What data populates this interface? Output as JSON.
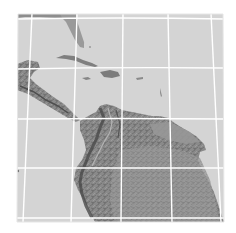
{
  "map": {
    "type": "shaded-relief",
    "region": "Caribbean and northern South America",
    "colors": {
      "background": "#ffffff",
      "ocean": "#d4d4d4",
      "land_light": "#a8a8a8",
      "land_mid": "#8c8c8c",
      "land_dark": "#6e6e6e",
      "ridge": "#4a4a4a",
      "gridline": "#ffffff"
    },
    "frame": {
      "x": 17,
      "y": 13,
      "width": 207,
      "height": 209
    },
    "graticule": {
      "horizontal_y": [
        19,
        68,
        119,
        168,
        218
      ],
      "vertical_top_x": [
        31,
        77,
        124,
        171,
        216
      ],
      "vertical_bottom_x": [
        23,
        71,
        121,
        172,
        221
      ]
    },
    "features": [
      {
        "name": "florida",
        "label": ""
      },
      {
        "name": "cuba",
        "label": ""
      },
      {
        "name": "hispaniola",
        "label": ""
      },
      {
        "name": "jamaica",
        "label": ""
      },
      {
        "name": "puerto-rico",
        "label": ""
      },
      {
        "name": "lesser-antilles",
        "label": ""
      },
      {
        "name": "central-america",
        "label": ""
      },
      {
        "name": "andes",
        "label": ""
      },
      {
        "name": "amazon-basin",
        "label": ""
      },
      {
        "name": "guiana-highlands",
        "label": ""
      }
    ]
  }
}
